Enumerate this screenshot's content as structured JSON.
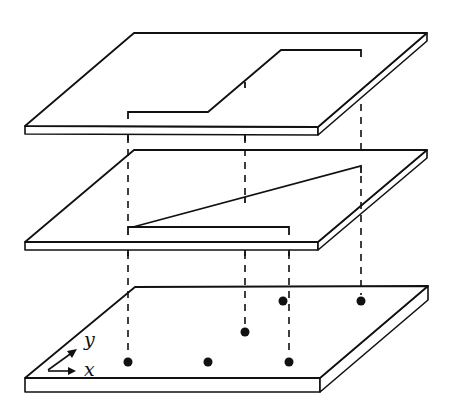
{
  "diagram": {
    "colors": {
      "stroke": "#111111",
      "background": "#ffffff"
    },
    "axes": {
      "x_label": "x",
      "y_label": "y"
    },
    "layers": [
      {
        "name": "top-plate",
        "content": "stepped path (horizontal, diagonal, horizontal)"
      },
      {
        "name": "middle-plate",
        "content": "sloped line and horizontal bar"
      },
      {
        "name": "bottom-plate",
        "content": "six points"
      }
    ],
    "points": [
      {
        "x": 128,
        "y": 362
      },
      {
        "x": 208,
        "y": 362
      },
      {
        "x": 289,
        "y": 362
      },
      {
        "x": 245,
        "y": 332
      },
      {
        "x": 283,
        "y": 301
      },
      {
        "x": 361,
        "y": 301
      }
    ]
  }
}
